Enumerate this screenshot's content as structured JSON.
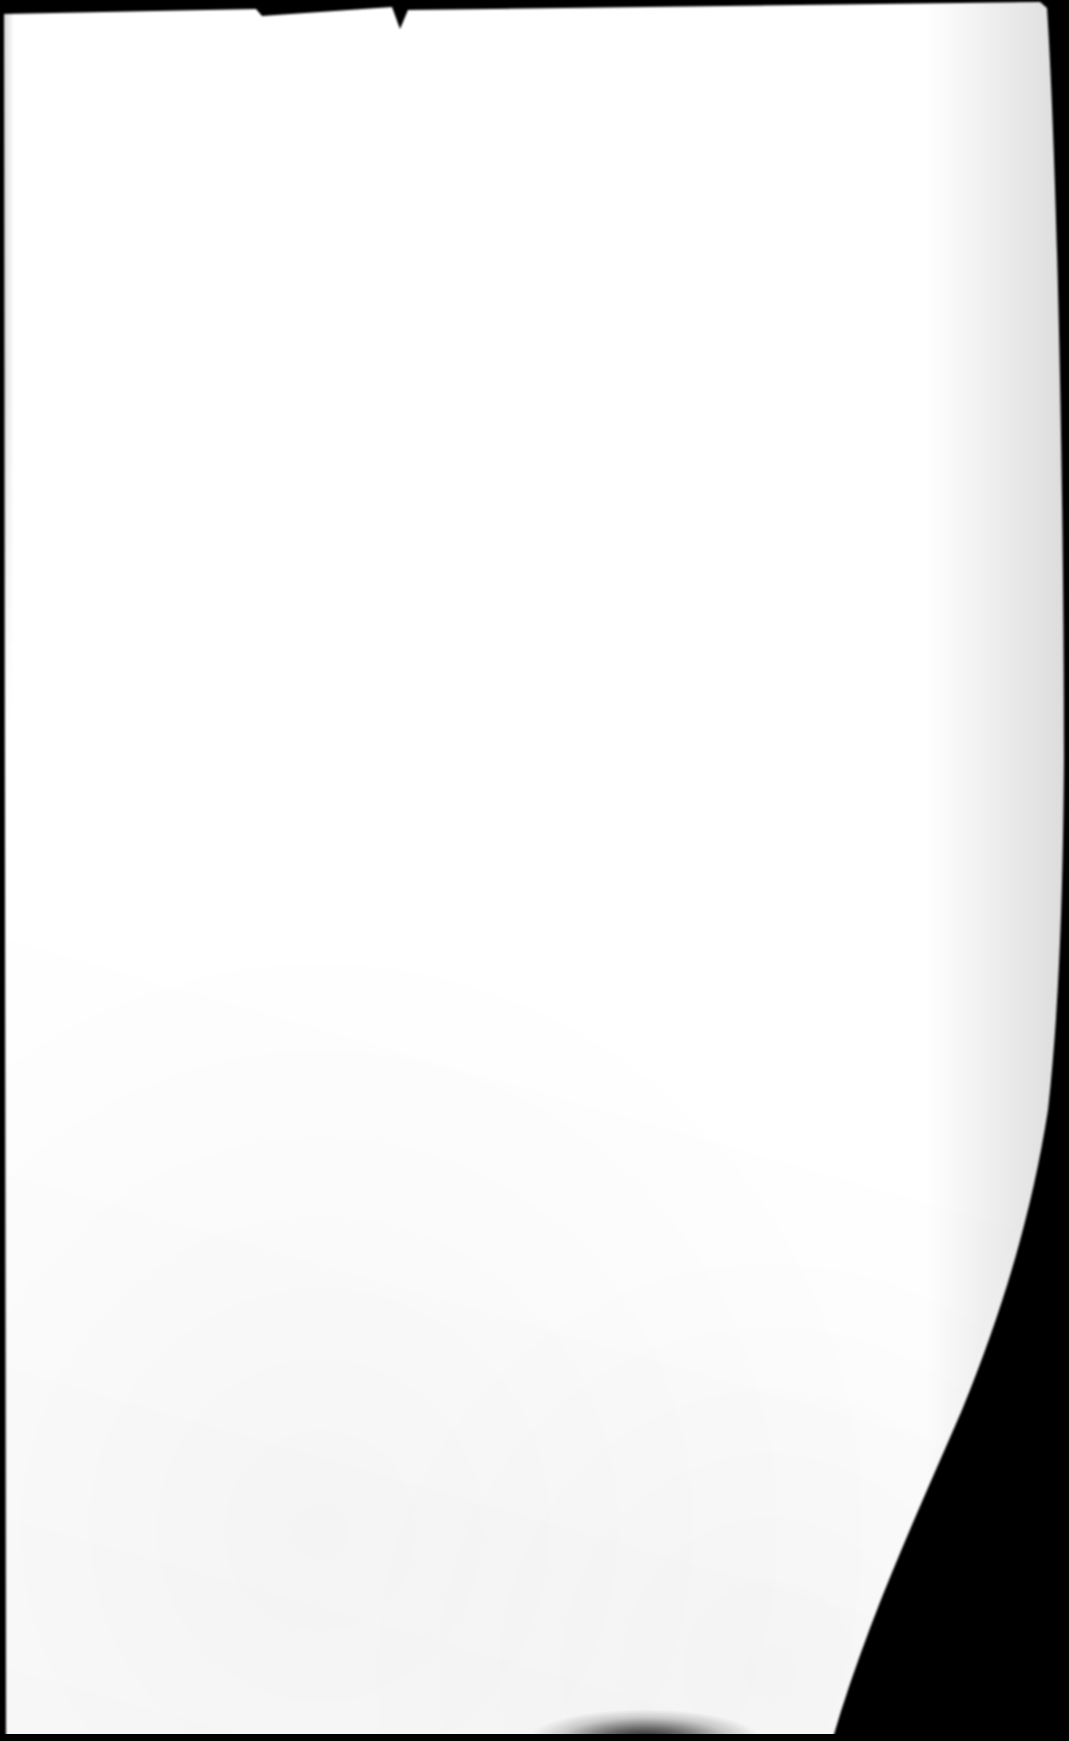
{
  "document": {
    "kind": "scanned-photograph",
    "subject": "blank sheet of paper",
    "page_content_text": "",
    "is_blank": true,
    "orientation": "portrait"
  },
  "canvas": {
    "width": 1069,
    "height": 1741,
    "backdrop_color": "#000000"
  },
  "paper": {
    "fill_color": "#ffffff",
    "edge_shadow_color": "#000000",
    "corners": {
      "top_left": [
        4,
        14
      ],
      "top_right": [
        1047,
        8
      ],
      "bottom_right": [
        832,
        1741
      ],
      "bottom_left": [
        6,
        1736
      ]
    },
    "right_edge_path_points": [
      [
        1047,
        8
      ],
      [
        1060,
        300
      ],
      [
        1064,
        700
      ],
      [
        1063,
        880
      ],
      [
        1059,
        1010
      ],
      [
        1048,
        1110
      ],
      [
        1030,
        1210
      ],
      [
        1006,
        1300
      ],
      [
        962,
        1410
      ],
      [
        915,
        1510
      ],
      [
        866,
        1620
      ],
      [
        832,
        1741
      ]
    ]
  },
  "top_border": {
    "name": "top-black-band",
    "color": "#000000",
    "height_left": 15,
    "height_right": 8,
    "notches": [
      {
        "x": 256,
        "depth": 7
      },
      {
        "x": 398,
        "depth": 22
      },
      {
        "x": 1040,
        "depth": 6
      }
    ]
  },
  "bottom_border": {
    "name": "bottom-black-band",
    "color": "#000000",
    "height": 7
  },
  "artifacts": {
    "bottom_edge_smudge": {
      "label": "dark shadow smear at bottom edge",
      "x_start": 560,
      "x_end": 740,
      "y": 1726
    },
    "left_edge_line": {
      "label": "thin dark trim line along left edge",
      "x": 0,
      "y_start": 12,
      "y_end": 640,
      "thickness": 3
    }
  }
}
